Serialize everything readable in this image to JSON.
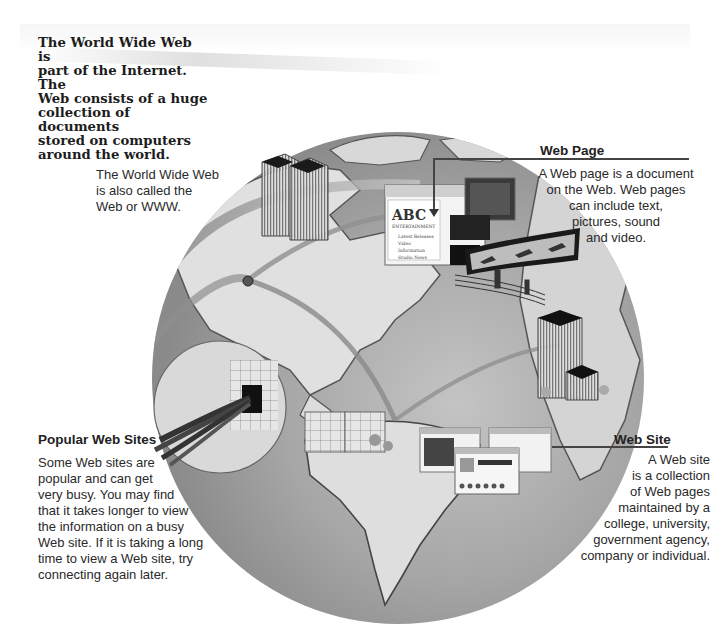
{
  "intro": {
    "lines": [
      "The World Wide Web is",
      "part of the Internet. The",
      "Web consists of a huge",
      "collection of documents",
      "stored on computers",
      "around the world."
    ]
  },
  "www_note": {
    "lines": [
      "The World Wide Web",
      "is also called the",
      "Web or WWW."
    ]
  },
  "web_page": {
    "title": "Web Page",
    "lines": [
      "A Web page is a document",
      "on the Web. Web pages",
      "can include text,",
      "pictures, sound",
      "and video."
    ],
    "screen_logo": "ABC",
    "screen_logo_sub": "ENTERTAINMENT",
    "screen_menu": [
      "Latest Releases",
      "Video",
      "Information",
      "Studio News"
    ]
  },
  "popular_sites": {
    "title": "Popular Web Sites",
    "lines": [
      "Some Web sites are",
      "popular and can get",
      "very busy. You may find",
      "that it takes longer to view",
      "the information on a busy",
      "Web site. If it is taking a long",
      "time to view a Web site, try",
      "connecting again later."
    ]
  },
  "web_site": {
    "title": "Web Site",
    "lines": [
      "A Web site",
      "is a collection",
      "of Web pages",
      "maintained by a",
      "college, university,",
      "government agency,",
      "company or individual."
    ]
  },
  "colors": {
    "ocean": "#9a9a9a",
    "land": "#d8d8d8",
    "rule": "#444444",
    "text": "#2a2a2a"
  }
}
